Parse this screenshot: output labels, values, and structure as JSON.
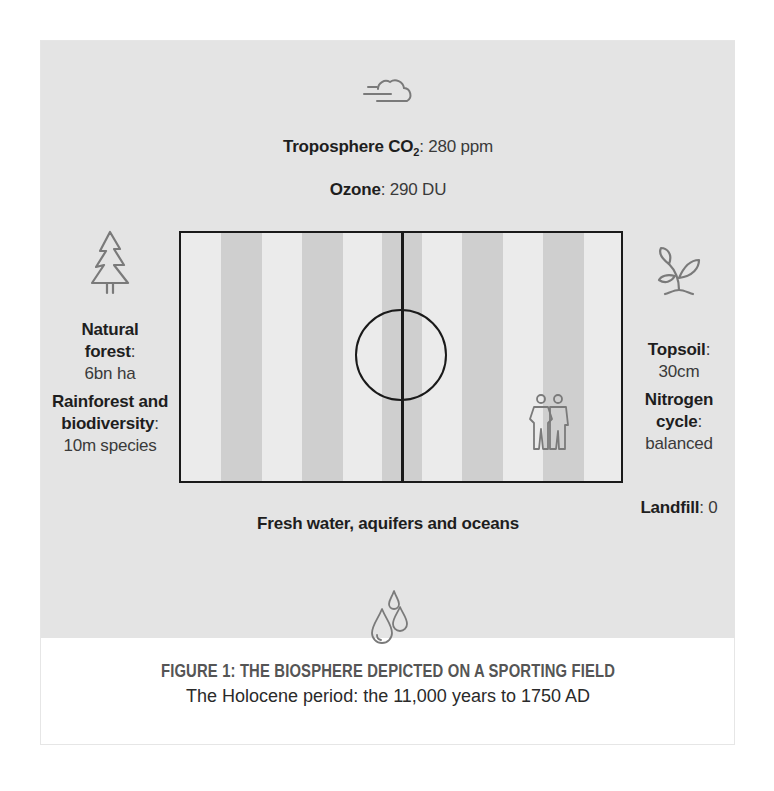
{
  "figure": {
    "title": "FIGURE 1: THE BIOSPHERE DEPICTED ON A SPORTING FIELD",
    "subtitle": "The Holocene period: the 11,000 years to 1750 AD"
  },
  "top": {
    "troposphere": {
      "label": "Troposphere CO",
      "subscript": "2",
      "separator": ":",
      "value": " 280 ppm"
    },
    "ozone": {
      "label": "Ozone",
      "separator": ":",
      "value": " 290 DU"
    },
    "icon": "cloud-wind-icon"
  },
  "left": {
    "icon": "tree-icon",
    "items": [
      {
        "label_line1": "Natural",
        "label_line2": "forest",
        "separator": ":",
        "value": "6bn ha"
      },
      {
        "label_line1": "Rainforest and",
        "label_line2": "biodiversity",
        "separator": ":",
        "value": "10m species"
      }
    ]
  },
  "right": {
    "icon": "plant-sprout-icon",
    "items": [
      {
        "label_line1": "Topsoil",
        "separator": ":",
        "value": "30cm"
      },
      {
        "label_line1": "Nitrogen",
        "label_line2": "cycle",
        "separator": ":",
        "value": "balanced"
      }
    ],
    "landfill": {
      "label": "Landfill",
      "separator": ":",
      "value": " 0"
    }
  },
  "bottom": {
    "label": "Fresh water, aquifers and oceans",
    "icon": "water-drops-icon"
  },
  "field": {
    "icon": "people-icon",
    "stripe_color": "#cfcfcf",
    "field_color": "#ebebeb",
    "line_color": "#1a1a1a",
    "panel_color": "#e4e4e4"
  }
}
